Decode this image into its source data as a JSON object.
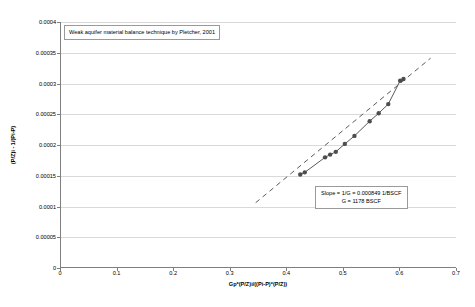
{
  "chart_data": {
    "type": "scatter",
    "title": "Weak aquifer material balance technique by Pletcher, 2001",
    "xlabel": "Gp*(P/Z)i/((Pi-P)*(P/Z))",
    "ylabel": "(P/Z)i - 1/(Pi-P)",
    "xlim": [
      0,
      0.7
    ],
    "ylim": [
      0,
      0.0004
    ],
    "xticks": [
      "0",
      "0.1",
      "0.2",
      "0.3",
      "0.4",
      "0.5",
      "0.6",
      "0.7"
    ],
    "xtick_values": [
      0,
      0.1,
      0.2,
      0.3,
      0.4,
      0.5,
      0.6,
      0.7
    ],
    "yticks": [
      "0",
      "0.00005",
      "0.0001",
      "0.00015",
      "0.0002",
      "0.00025",
      "0.0003",
      "0.00035",
      "0.0004"
    ],
    "ytick_values": [
      0,
      5e-05,
      0.0001,
      0.00015,
      0.0002,
      0.00025,
      0.0003,
      0.00035,
      0.0004
    ],
    "grid": "horizontal",
    "legend": "none",
    "marker_color": "#4d4d4d",
    "line_color": "#595959",
    "series": [
      {
        "name": "data",
        "x": [
          0.424,
          0.432,
          0.468,
          0.477,
          0.487,
          0.503,
          0.52,
          0.547,
          0.563,
          0.58,
          0.601,
          0.607
        ],
        "y": [
          0.000151,
          0.0001545,
          0.000179,
          0.0001835,
          0.000188,
          0.000201,
          0.000214,
          0.000238,
          0.000251,
          0.000266,
          0.000304,
          0.000307
        ]
      }
    ],
    "trendline": {
      "style": "dashed",
      "x_start": 0.345,
      "y_start": 0.000105,
      "x_end": 0.655,
      "y_end": 0.000341
    },
    "annotations": [
      {
        "name": "slope-box",
        "lines": [
          "Slope = 1/G = 0.000849 1/BSCF",
          "G = 1178 BSCF"
        ]
      }
    ],
    "slope": 0.000849,
    "slope_units": "1/BSCF",
    "gas_in_place": 1178,
    "gas_in_place_units": "BSCF"
  },
  "title_box": {
    "text": "Weak aquifer material balance technique by Pletcher, 2001"
  },
  "slope_box": {
    "line1": "Slope = 1/G = 0.000849 1/BSCF",
    "line2": "G = 1178 BSCF"
  },
  "axes": {
    "x_title": "Gp*(P/Z)i/((Pi-P)*(P/Z))",
    "y_title": "(P/Z)i - 1/(Pi-P)"
  }
}
